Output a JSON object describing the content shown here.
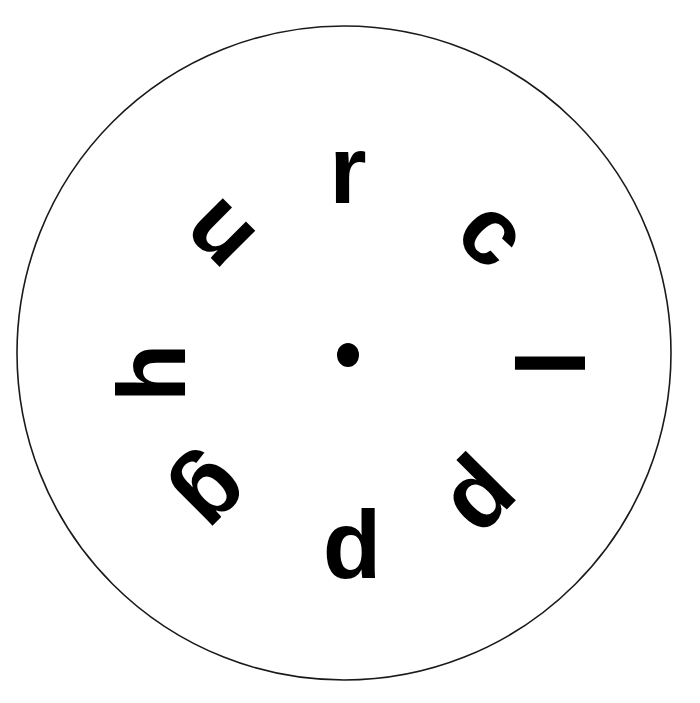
{
  "figure": {
    "type": "letter-dial-stimulus",
    "background_color": "#ffffff",
    "ink_color": "#000000"
  },
  "dial": {
    "outline_color": "#1a1a1a",
    "outline_width_px": 1.6,
    "fill_color": "#ffffff",
    "center_x": 344,
    "center_y": 353,
    "radius": 327
  },
  "center_marker": {
    "name": "center-dot",
    "color": "#000000",
    "center_x": 348,
    "center_y": 355,
    "radius_x": 11,
    "radius_y": 12
  },
  "letters": [
    {
      "char": "r",
      "position_name": "top",
      "clock_position": "12 o'clock",
      "angle_deg": 0,
      "rotation_deg": 0,
      "x": 348,
      "y": 170,
      "font_size": 96
    },
    {
      "char": "c",
      "position_name": "upper-right",
      "clock_position": "1:30",
      "angle_deg": 45,
      "rotation_deg": 45,
      "x": 494,
      "y": 232,
      "font_size": 96
    },
    {
      "char": "l",
      "position_name": "right",
      "clock_position": "3 o'clock",
      "angle_deg": 90,
      "rotation_deg": 90,
      "x": 548,
      "y": 363,
      "font_size": 96
    },
    {
      "char": "p",
      "position_name": "lower-right",
      "clock_position": "4:30",
      "angle_deg": 135,
      "rotation_deg": 135,
      "x": 487,
      "y": 504,
      "font_size": 96
    },
    {
      "char": "d",
      "position_name": "bottom",
      "clock_position": "6 o'clock",
      "angle_deg": 180,
      "rotation_deg": 0,
      "x": 352,
      "y": 545,
      "font_size": 96
    },
    {
      "char": "g",
      "position_name": "lower-left",
      "clock_position": "7:30",
      "angle_deg": 225,
      "rotation_deg": 135,
      "x": 216,
      "y": 497,
      "font_size": 96
    },
    {
      "char": "h",
      "position_name": "left",
      "clock_position": "9 o'clock",
      "angle_deg": 270,
      "rotation_deg": -90,
      "x": 152,
      "y": 373,
      "font_size": 96
    },
    {
      "char": "n",
      "position_name": "upper-left",
      "clock_position": "10:30",
      "angle_deg": 315,
      "rotation_deg": -135,
      "x": 216,
      "y": 238,
      "font_size": 96
    }
  ],
  "reading": {
    "clockwise_from_top": "r c l p d g h n"
  }
}
